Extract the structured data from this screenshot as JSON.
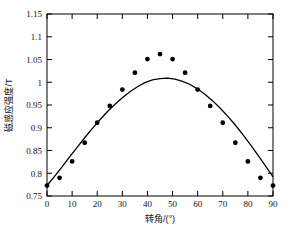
{
  "chart_data": {
    "type": "scatter",
    "title": "",
    "xlabel": "转角/(°)",
    "ylabel": "磁感应强度/T",
    "xlim": [
      0,
      90
    ],
    "ylim": [
      0.75,
      1.15
    ],
    "xticks": [
      0,
      10,
      20,
      30,
      40,
      50,
      60,
      70,
      80,
      90
    ],
    "xtick_labels": [
      "0",
      "10",
      "20",
      "30",
      "40",
      "50",
      "60",
      "70",
      "80",
      "90"
    ],
    "yticks": [
      0.75,
      0.8,
      0.85,
      0.9,
      0.95,
      1.0,
      1.05,
      1.1,
      1.15
    ],
    "ytick_labels": [
      "0.75",
      "0.8",
      "0.85",
      "0.9",
      "0.95",
      "1",
      "1.05",
      "1.1",
      "1.15"
    ],
    "grid": false,
    "legend": "none",
    "series": [
      {
        "name": "measured",
        "type": "scatter",
        "marker": "filled-circle",
        "color": "#000000",
        "x": [
          0,
          5,
          10,
          15,
          20,
          25,
          30,
          35,
          40,
          45,
          50,
          55,
          60,
          65,
          70,
          75,
          80,
          85,
          90
        ],
        "y": [
          0.773,
          0.79,
          0.826,
          0.867,
          0.911,
          0.948,
          0.984,
          1.021,
          1.051,
          1.062,
          1.051,
          1.021,
          0.984,
          0.948,
          0.911,
          0.867,
          0.826,
          0.79,
          0.773
        ]
      },
      {
        "name": "fitted curve",
        "type": "line",
        "color": "#000000",
        "x": [
          0,
          3,
          6,
          9,
          12,
          15,
          18,
          21,
          24,
          27,
          30,
          33,
          36,
          39,
          42,
          45,
          48,
          51,
          54,
          57,
          60,
          63,
          66,
          69,
          72,
          75,
          78,
          81,
          84,
          87,
          90
        ],
        "y": [
          0.773,
          0.793,
          0.814,
          0.836,
          0.857,
          0.878,
          0.898,
          0.917,
          0.935,
          0.951,
          0.966,
          0.979,
          0.99,
          0.999,
          1.005,
          1.008,
          1.009,
          1.007,
          1.002,
          0.995,
          0.985,
          0.973,
          0.959,
          0.943,
          0.925,
          0.906,
          0.885,
          0.863,
          0.84,
          0.816,
          0.792
        ]
      }
    ]
  },
  "figure": {
    "background_color": "#ffffff",
    "axis_color": "#000000",
    "marker_color": "#000000"
  }
}
